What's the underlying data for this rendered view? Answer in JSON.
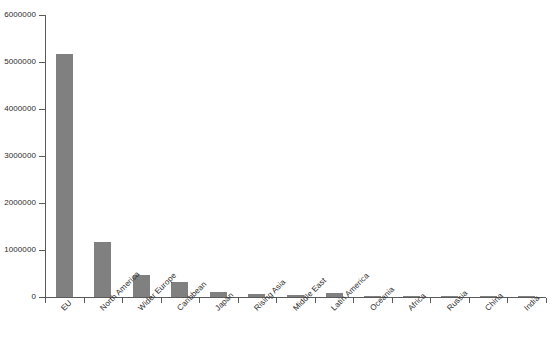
{
  "chart_data": {
    "type": "bar",
    "title": "",
    "subtitle": "",
    "xlabel": "",
    "ylabel": "",
    "categories": [
      "EU",
      "North America",
      "Wider Europe",
      "Caribbean",
      "Japan",
      "Rising Asia",
      "Middle East",
      "Latin America",
      "Oceania",
      "Africa",
      "Russia",
      "China",
      "India"
    ],
    "values": [
      5160000,
      1160000,
      470000,
      320000,
      110000,
      70000,
      50000,
      75000,
      20000,
      15000,
      30000,
      8000,
      5000
    ],
    "ylim": [
      0,
      6000000
    ],
    "yticks": [
      0,
      1000000,
      2000000,
      3000000,
      4000000,
      5000000,
      6000000
    ],
    "ytick_labels": [
      "0",
      "1000000",
      "2000000",
      "3000000",
      "4000000",
      "5000000",
      "6000000"
    ],
    "grid": false,
    "legend": "none",
    "bar_color": "#808080",
    "axis_color": "#5a5a5a",
    "text_color": "#2b2b2b",
    "background": "#ffffff"
  }
}
